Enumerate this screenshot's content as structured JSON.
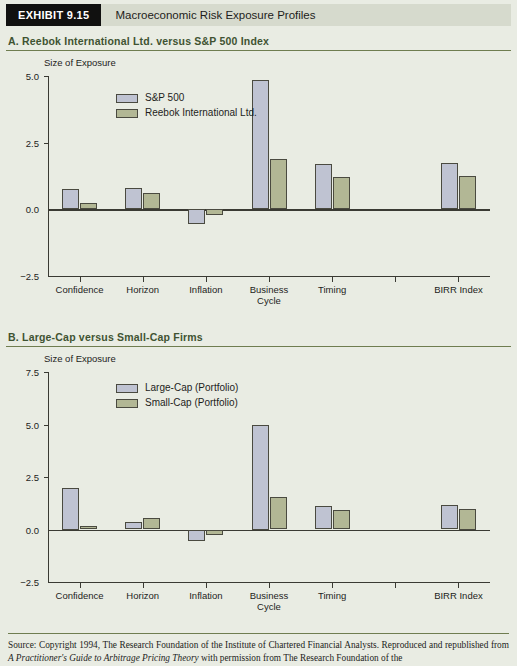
{
  "exhibit": {
    "tag": "EXHIBIT 9.15",
    "title": "Macroeconomic Risk Exposure Profiles"
  },
  "colors": {
    "page_background": "#e9ece3",
    "tag_background": "#111110",
    "title_band": "#d6dacd",
    "rule": "#6f7d50",
    "heading_text": "#3f5332",
    "series_primary": "#bfc3d2",
    "series_secondary": "#b2b795",
    "bar_outline": "#4a4a40",
    "axis": "#3a3a33"
  },
  "sections": [
    {
      "heading": "A. Reebok International Ltd. versus S&P 500 Index",
      "chart_index": 0
    },
    {
      "heading": "B. Large-Cap versus Small-Cap Firms",
      "chart_index": 1
    }
  ],
  "source": {
    "prefix": "Source: Copyright 1994, The Research Foundation of the Institute of Chartered Financial Analysts. Reproduced and republished from ",
    "italic_title": "A Practitioner's Guide to Arbitrage Pricing Theory",
    "suffix": " with permission from The Research Foundation of the"
  },
  "chart_data": [
    {
      "type": "bar",
      "title": "A. Reebok International Ltd. versus S&P 500 Index",
      "ylabel": "Size of Exposure",
      "xlabel": "",
      "ylim": [
        -2.5,
        5.0
      ],
      "yticks": [
        "5.0",
        "2.5",
        "0.0",
        "-2.5"
      ],
      "ytick_values": [
        5.0,
        2.5,
        0.0,
        -2.5
      ],
      "grid": false,
      "legend_position": "upper-left-inside",
      "categories": [
        "Confidence",
        "Horizon",
        "Inflation",
        "Business Cycle",
        "Timing",
        "",
        "BIRR Index"
      ],
      "category_lines": [
        [
          "Confidence"
        ],
        [
          "Horizon"
        ],
        [
          "Inflation"
        ],
        [
          "Business",
          "Cycle"
        ],
        [
          "Timing"
        ],
        [
          ""
        ],
        [
          "BIRR Index"
        ]
      ],
      "series": [
        {
          "name": "S&P 500",
          "color": "#bfc3d2",
          "values": [
            0.78,
            0.8,
            -0.55,
            4.85,
            1.7,
            null,
            1.72
          ]
        },
        {
          "name": "Reebok International Ltd.",
          "color": "#b2b795",
          "values": [
            0.25,
            0.6,
            -0.22,
            1.9,
            1.2,
            null,
            1.25
          ]
        }
      ]
    },
    {
      "type": "bar",
      "title": "B. Large-Cap versus Small-Cap Firms",
      "ylabel": "Size of Exposure",
      "xlabel": "",
      "ylim": [
        -2.5,
        7.5
      ],
      "yticks": [
        "7.5",
        "5.0",
        "2.5",
        "0.0",
        "-2.5"
      ],
      "ytick_values": [
        7.5,
        5.0,
        2.5,
        0.0,
        -2.5
      ],
      "grid": false,
      "legend_position": "upper-left-inside",
      "categories": [
        "Confidence",
        "Horizon",
        "Inflation",
        "Business Cycle",
        "Timing",
        "",
        "BIRR Index"
      ],
      "category_lines": [
        [
          "Confidence"
        ],
        [
          "Horizon"
        ],
        [
          "Inflation"
        ],
        [
          "Business",
          "Cycle"
        ],
        [
          "Timing"
        ],
        [
          ""
        ],
        [
          "BIRR Index"
        ]
      ],
      "series": [
        {
          "name": "Large-Cap (Portfolio)",
          "color": "#bfc3d2",
          "values": [
            2.0,
            0.35,
            -0.55,
            5.0,
            1.1,
            null,
            1.15
          ]
        },
        {
          "name": "Small-Cap (Portfolio)",
          "color": "#b2b795",
          "values": [
            0.15,
            0.55,
            -0.25,
            1.55,
            0.95,
            null,
            1.0
          ]
        }
      ]
    }
  ]
}
